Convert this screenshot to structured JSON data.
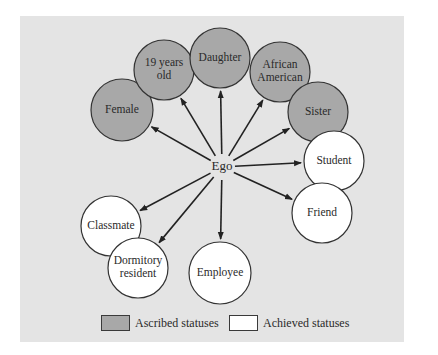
{
  "colors": {
    "panel_bg": "#e4e4e4",
    "ascribed_fill": "#a8a8a8",
    "achieved_fill": "#ffffff",
    "stroke": "#333333"
  },
  "center": {
    "label": "Ego",
    "x": 222,
    "y": 167
  },
  "nodes": [
    {
      "id": "female",
      "lines": [
        "Female"
      ],
      "type": "ascribed",
      "x": 122,
      "y": 110,
      "r": 31
    },
    {
      "id": "19-years-old",
      "lines": [
        "19 years",
        "old"
      ],
      "type": "ascribed",
      "x": 164,
      "y": 70,
      "r": 30
    },
    {
      "id": "daughter",
      "lines": [
        "Daughter"
      ],
      "type": "ascribed",
      "x": 220,
      "y": 58,
      "r": 30
    },
    {
      "id": "african-american",
      "lines": [
        "African",
        "American"
      ],
      "type": "ascribed",
      "x": 280,
      "y": 72,
      "r": 30
    },
    {
      "id": "sister",
      "lines": [
        "Sister"
      ],
      "type": "ascribed",
      "x": 318,
      "y": 112,
      "r": 30
    },
    {
      "id": "student",
      "lines": [
        "Student"
      ],
      "type": "achieved",
      "x": 334,
      "y": 161,
      "r": 30
    },
    {
      "id": "friend",
      "lines": [
        "Friend"
      ],
      "type": "achieved",
      "x": 322,
      "y": 213,
      "r": 30
    },
    {
      "id": "classmate",
      "lines": [
        "Classmate"
      ],
      "type": "achieved",
      "x": 111,
      "y": 226,
      "r": 30
    },
    {
      "id": "dormitory-resident",
      "lines": [
        "Dormitory",
        "resident"
      ],
      "type": "achieved",
      "x": 138,
      "y": 268,
      "r": 30
    },
    {
      "id": "employee",
      "lines": [
        "Employee"
      ],
      "type": "achieved",
      "x": 220,
      "y": 273,
      "r": 31
    }
  ],
  "legend": {
    "ascribed_label": "Ascribed statuses",
    "achieved_label": "Achieved statuses"
  }
}
